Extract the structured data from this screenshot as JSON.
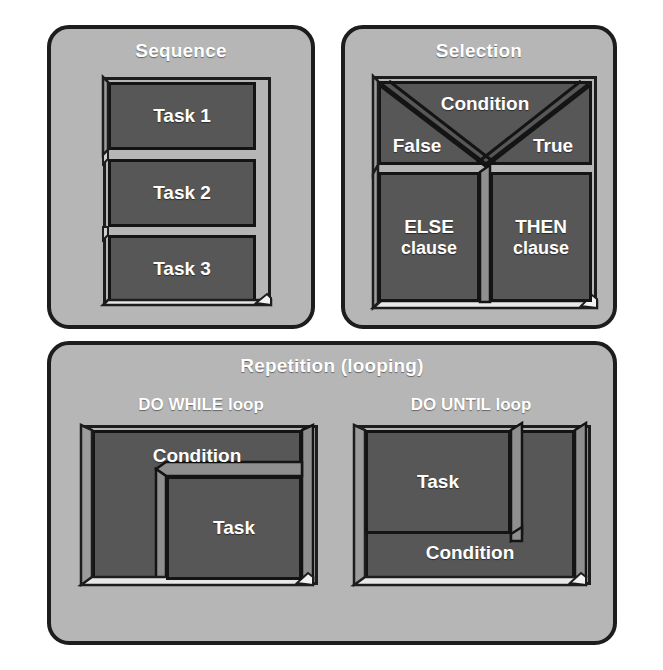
{
  "figure": {
    "background_color": "#ffffff",
    "panel_color": "#b6b6b6",
    "block_color": "#575757",
    "block_side_color": "#8f8f8f",
    "outline_color": "#1d1d1d",
    "text_color": "#ffffff"
  },
  "sequence": {
    "title": "Sequence",
    "blocks": [
      {
        "label": "Task 1"
      },
      {
        "label": "Task 2"
      },
      {
        "label": "Task 3"
      }
    ]
  },
  "selection": {
    "title": "Selection",
    "condition": {
      "label": "Condition"
    },
    "branches": {
      "false_label": "False",
      "true_label": "True"
    },
    "clauses": [
      {
        "label_line1": "ELSE",
        "label_line2": "clause"
      },
      {
        "label_line1": "THEN",
        "label_line2": "clause"
      }
    ]
  },
  "repetition": {
    "title": "Repetition (looping)",
    "loops": [
      {
        "name": "DO WHILE loop",
        "outer_block": "Condition",
        "inner_block": "Task"
      },
      {
        "name": "DO UNTIL loop",
        "outer_block": "Condition",
        "inner_block": "Task"
      }
    ]
  }
}
